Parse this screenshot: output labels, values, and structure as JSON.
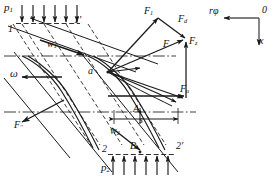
{
  "figure": {
    "type": "engineering-vector-diagram"
  },
  "labels": {
    "p1": {
      "base": "p",
      "sub": "1",
      "x": 4,
      "y": 2
    },
    "station_1": {
      "text": "1",
      "x": 8,
      "y": 24
    },
    "station_1p": {
      "text": "1'",
      "x": 74,
      "y": 15
    },
    "w1": {
      "base": "w",
      "sub": "1",
      "x": 47,
      "y": 39
    },
    "omega": {
      "text": "ω",
      "x": 10,
      "y": 68
    },
    "point_a": {
      "text": "a",
      "x": 88,
      "y": 66
    },
    "F1": {
      "base": "F",
      "sub": "1",
      "x": 144,
      "y": 6
    },
    "Fd": {
      "base": "F",
      "sub": "d",
      "x": 178,
      "y": 14
    },
    "F": {
      "text": "F",
      "x": 163,
      "y": 39
    },
    "Fz": {
      "base": "F",
      "sub": "z",
      "x": 189,
      "y": 36
    },
    "Fu": {
      "base": "F",
      "sub": "u",
      "x": 180,
      "y": 84
    },
    "F2": {
      "base": "F",
      "sub": "''",
      "x": 14,
      "y": 120
    },
    "point_A": {
      "text": "A",
      "x": 133,
      "y": 104
    },
    "s": {
      "text": "s",
      "x": 139,
      "y": 115
    },
    "w2": {
      "base": "w",
      "sub": "2",
      "x": 110,
      "y": 126
    },
    "point_B": {
      "text": "B",
      "x": 130,
      "y": 141
    },
    "station_2": {
      "text": "2",
      "x": 102,
      "y": 144
    },
    "station_2p": {
      "text": "2'",
      "x": 176,
      "y": 141
    },
    "p2": {
      "base": "p",
      "sub": "2",
      "x": 101,
      "y": 162
    },
    "axis_rphi": {
      "text": "rφ",
      "x": 209,
      "y": 6
    },
    "axis_origin": {
      "text": "0",
      "x": 262,
      "y": 5
    },
    "axis_x": {
      "text": "x",
      "x": 259,
      "y": 36
    }
  },
  "colors": {
    "ink": "#1a1a1a",
    "background": "#ffffff"
  }
}
